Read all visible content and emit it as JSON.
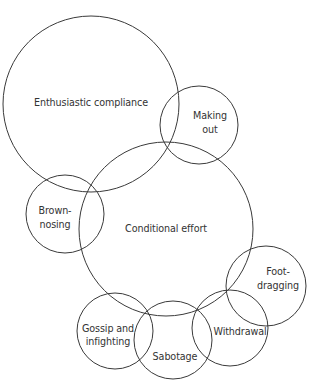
{
  "diagram": {
    "type": "overlapping-circles",
    "stroke_color": "#3a3a3a",
    "text_color": "#333333",
    "background": "#ffffff",
    "circles": [
      {
        "id": "enthusiastic-compliance",
        "cx": 91,
        "cy": 104,
        "r": 88,
        "lines": [
          "Enthusiastic compliance"
        ],
        "label_x": 91,
        "label_y": 106
      },
      {
        "id": "making-out",
        "cx": 199,
        "cy": 125,
        "r": 39,
        "lines": [
          "Making",
          "out"
        ],
        "label_x": 210,
        "label_y": 119
      },
      {
        "id": "conditional-effort",
        "cx": 166,
        "cy": 229,
        "r": 87,
        "lines": [
          "Conditional effort"
        ],
        "label_x": 166,
        "label_y": 232
      },
      {
        "id": "brown-nosing",
        "cx": 65,
        "cy": 214,
        "r": 39,
        "lines": [
          "Brown-",
          "nosing"
        ],
        "label_x": 55,
        "label_y": 214
      },
      {
        "id": "foot-dragging",
        "cx": 266,
        "cy": 286,
        "r": 40,
        "lines": [
          "Foot-",
          "dragging"
        ],
        "label_x": 278,
        "label_y": 275
      },
      {
        "id": "gossip-and-infighting",
        "cx": 115,
        "cy": 331,
        "r": 38,
        "lines": [
          "Gossip and",
          "infighting"
        ],
        "label_x": 108,
        "label_y": 332
      },
      {
        "id": "sabotage",
        "cx": 173,
        "cy": 340,
        "r": 39,
        "lines": [
          "Sabotage"
        ],
        "label_x": 175,
        "label_y": 360
      },
      {
        "id": "withdrawal",
        "cx": 230,
        "cy": 328,
        "r": 38,
        "lines": [
          "Withdrawal"
        ],
        "label_x": 240,
        "label_y": 335
      }
    ]
  },
  "labels": {
    "enthusiastic_compliance": "Enthusiastic compliance",
    "making_out_1": "Making",
    "making_out_2": "out",
    "conditional_effort": "Conditional effort",
    "brown_nosing_1": "Brown-",
    "brown_nosing_2": "nosing",
    "foot_dragging_1": "Foot-",
    "foot_dragging_2": "dragging",
    "gossip_1": "Gossip and",
    "gossip_2": "infighting",
    "sabotage": "Sabotage",
    "withdrawal": "Withdrawal"
  }
}
